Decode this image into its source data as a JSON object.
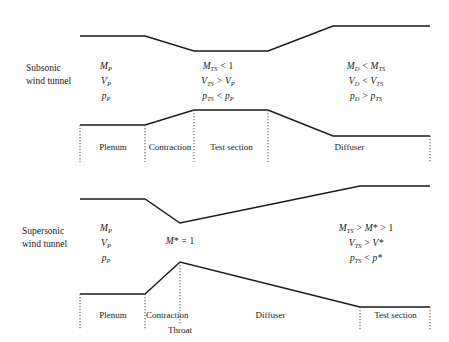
{
  "figure": {
    "type": "engineering-diagram"
  },
  "subsonic": {
    "side_label": "Subsonic\nwind tunnel",
    "equations": {
      "plenum": [
        "M_P",
        "V_P",
        "p_P"
      ],
      "plenum_html": [
        "M<sub>P</sub>",
        "V<sub>P</sub>",
        "p<sub>P</sub>"
      ],
      "test_section": [
        "M_TS < 1",
        "V_TS > V_P",
        "p_TS < p_P"
      ],
      "test_section_html": [
        "M<sub>TS</sub> &lt; <span class='up'>1</span>",
        "V<sub>TS</sub> &gt; V<sub>P</sub>",
        "p<sub>TS</sub> &lt; p<sub>P</sub>"
      ],
      "diffuser": [
        "M_D < M_TS",
        "V_D < V_TS",
        "p_D > p_TS"
      ],
      "diffuser_html": [
        "M<sub>D</sub> &lt; M<sub>TS</sub>",
        "V<sub>D</sub> &lt; V<sub>TS</sub>",
        "p<sub>D</sub> &gt; p<sub>TS</sub>"
      ]
    },
    "sections": [
      {
        "name": "plenum",
        "label": "Plenum"
      },
      {
        "name": "contraction",
        "label": "Contraction"
      },
      {
        "name": "test-section",
        "label": "Test section"
      },
      {
        "name": "diffuser",
        "label": "Diffuser"
      }
    ]
  },
  "supersonic": {
    "side_label": "Supersonic\nwind tunnel",
    "equations": {
      "plenum": [
        "M_P",
        "V_P",
        "p_P"
      ],
      "plenum_html": [
        "M<sub>P</sub>",
        "V<sub>P</sub>",
        "p<sub>P</sub>"
      ],
      "throat": "M* = 1",
      "throat_html": "M* = <span class='up'>1</span>",
      "test_section": [
        "M_TS > M* > 1",
        "V_TS > V*",
        "p_TS < p*"
      ],
      "test_section_html": [
        "M<sub>TS</sub> &gt; M* &gt; <span class='up'>1</span>",
        "V<sub>TS</sub> &gt; V*",
        "p<sub>TS</sub> &lt; p*"
      ]
    },
    "sections": [
      {
        "name": "plenum",
        "label": "Plenum"
      },
      {
        "name": "contraction",
        "label": "Contraction"
      },
      {
        "name": "diffuser",
        "label": "Diffuser"
      },
      {
        "name": "test-section",
        "label": "Test section"
      }
    ],
    "throat_label": "Throat"
  },
  "style": {
    "wall_color": "#1a1a1a",
    "divider_color": "#555555",
    "background": "#ffffff"
  }
}
